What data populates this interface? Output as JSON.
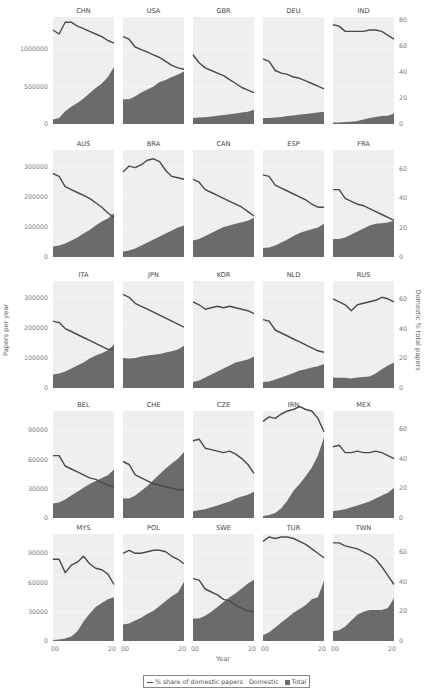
{
  "chart_data": {
    "type": "area",
    "title": "",
    "xlabel": "Year",
    "ylabel": "Papers per year",
    "y2label": "Domestic % total papers",
    "x": [
      2000,
      2002,
      2004,
      2006,
      2008,
      2010,
      2012,
      2014,
      2016,
      2018,
      2020
    ],
    "x_tick_labels": [
      "00",
      "20",
      "00",
      "20",
      "00",
      "20",
      "00",
      "20",
      "00",
      "20"
    ],
    "legend": [
      {
        "kind": "line",
        "label": "% share of domestic papers"
      },
      {
        "kind": "text",
        "label": "Domestic"
      },
      {
        "kind": "box",
        "label": "Total"
      }
    ],
    "colors": {
      "area": "#6b6b6b",
      "line": "#4a4a4a",
      "panel": "#efefef"
    },
    "rows": [
      {
        "left_ticks": [
          0,
          500000,
          1000000
        ],
        "left_tick_labels": [
          "0",
          "500000",
          "1000000"
        ],
        "left_max": 1430000,
        "right_ticks": [
          0,
          20,
          40,
          60,
          80
        ],
        "right_max": 82,
        "panels": [
          {
            "name": "CHN",
            "total": [
              60000,
              80000,
              170000,
              230000,
              280000,
              340000,
              410000,
              480000,
              540000,
              630000,
              760000
            ],
            "share": [
              72,
              69,
              78,
              78,
              75,
              73,
              71,
              69,
              67,
              64,
              62
            ]
          },
          {
            "name": "USA",
            "total": [
              330000,
              330000,
              370000,
              420000,
              460000,
              500000,
              560000,
              590000,
              630000,
              660000,
              700000
            ],
            "share": [
              67,
              65,
              59,
              57,
              55,
              53,
              51,
              48,
              45,
              43,
              42
            ]
          },
          {
            "name": "GBR",
            "total": [
              80000,
              85000,
              90000,
              100000,
              110000,
              120000,
              130000,
              140000,
              155000,
              165000,
              190000
            ],
            "share": [
              53,
              47,
              43,
              41,
              39,
              37,
              34,
              31,
              28,
              26,
              24
            ]
          },
          {
            "name": "DEU",
            "total": [
              80000,
              80000,
              85000,
              95000,
              105000,
              115000,
              125000,
              135000,
              145000,
              155000,
              165000
            ],
            "share": [
              50,
              48,
              41,
              39,
              38,
              36,
              35,
              33,
              31,
              29,
              27
            ]
          },
          {
            "name": "IND",
            "total": [
              20000,
              22000,
              25000,
              30000,
              40000,
              60000,
              80000,
              95000,
              105000,
              110000,
              140000
            ],
            "share": [
              76,
              75,
              71,
              71,
              71,
              71,
              72,
              72,
              71,
              68,
              65
            ]
          }
        ]
      },
      {
        "left_ticks": [
          0,
          100000,
          200000,
          300000
        ],
        "left_tick_labels": [
          "0",
          "100000",
          "200000",
          "300000"
        ],
        "left_max": 355000,
        "right_ticks": [
          0,
          20,
          40,
          60
        ],
        "right_max": 73,
        "panels": [
          {
            "name": "AUS",
            "total": [
              35000,
              38000,
              45000,
              55000,
              65000,
              78000,
              90000,
              105000,
              118000,
              128000,
              145000
            ],
            "share": [
              57,
              55,
              48,
              46,
              44,
              42,
              40,
              37,
              34,
              30,
              27
            ]
          },
          {
            "name": "BRA",
            "total": [
              18000,
              22000,
              28000,
              38000,
              48000,
              58000,
              68000,
              78000,
              88000,
              98000,
              105000
            ],
            "share": [
              58,
              62,
              61,
              63,
              66,
              67,
              65,
              59,
              55,
              54,
              53
            ]
          },
          {
            "name": "CAN",
            "total": [
              55000,
              60000,
              70000,
              80000,
              90000,
              100000,
              105000,
              110000,
              115000,
              120000,
              130000
            ],
            "share": [
              53,
              51,
              46,
              44,
              42,
              40,
              38,
              36,
              34,
              31,
              28
            ]
          },
          {
            "name": "ESP",
            "total": [
              30000,
              32000,
              38000,
              48000,
              58000,
              70000,
              80000,
              86000,
              92000,
              98000,
              110000
            ],
            "share": [
              56,
              55,
              49,
              47,
              45,
              43,
              41,
              39,
              36,
              34,
              34
            ]
          },
          {
            "name": "FRA",
            "total": [
              60000,
              60000,
              65000,
              75000,
              85000,
              95000,
              105000,
              110000,
              112000,
              114000,
              120000
            ],
            "share": [
              46,
              46,
              40,
              38,
              36,
              35,
              33,
              31,
              29,
              27,
              25
            ]
          }
        ]
      },
      {
        "left_ticks": [
          0,
          100000,
          200000,
          300000
        ],
        "left_tick_labels": [
          "0",
          "100000",
          "200000",
          "300000"
        ],
        "left_max": 355000,
        "right_ticks": [
          0,
          20,
          40,
          60
        ],
        "right_max": 72,
        "panels": [
          {
            "name": "ITA",
            "total": [
              45000,
              48000,
              55000,
              65000,
              75000,
              85000,
              98000,
              108000,
              115000,
              125000,
              145000
            ],
            "share": [
              45,
              44,
              40,
              38,
              36,
              34,
              32,
              30,
              28,
              26,
              26
            ]
          },
          {
            "name": "JPN",
            "total": [
              100000,
              98000,
              100000,
              105000,
              108000,
              110000,
              113000,
              118000,
              122000,
              128000,
              140000
            ],
            "share": [
              63,
              61,
              57,
              55,
              53,
              51,
              49,
              47,
              45,
              43,
              41
            ]
          },
          {
            "name": "KOR",
            "total": [
              20000,
              25000,
              35000,
              45000,
              55000,
              65000,
              75000,
              85000,
              90000,
              95000,
              105000
            ],
            "share": [
              58,
              56,
              53,
              54,
              55,
              54,
              55,
              54,
              53,
              52,
              50
            ]
          },
          {
            "name": "NLD",
            "total": [
              20000,
              22000,
              28000,
              35000,
              42000,
              50000,
              58000,
              62000,
              68000,
              72000,
              80000
            ],
            "share": [
              46,
              45,
              39,
              37,
              35,
              33,
              31,
              29,
              27,
              25,
              24
            ]
          },
          {
            "name": "RUS",
            "total": [
              35000,
              34000,
              34000,
              32000,
              35000,
              36000,
              38000,
              48000,
              62000,
              75000,
              85000
            ],
            "share": [
              60,
              58,
              56,
              52,
              56,
              57,
              58,
              59,
              61,
              60,
              58
            ]
          }
        ]
      },
      {
        "left_ticks": [
          0,
          30000,
          60000,
          90000
        ],
        "left_tick_labels": [
          "0",
          "30000",
          "60000",
          "90000"
        ],
        "left_max": 110000,
        "right_ticks": [
          0,
          20,
          40,
          60
        ],
        "right_max": 72,
        "panels": [
          {
            "name": "BEL",
            "total": [
              15000,
              16000,
              19000,
              23000,
              27000,
              31000,
              35000,
              38000,
              41000,
              44000,
              50000
            ],
            "share": [
              42,
              42,
              35,
              33,
              31,
              29,
              27,
              26,
              24,
              22,
              21
            ]
          },
          {
            "name": "CHE",
            "total": [
              20000,
              20000,
              23000,
              28000,
              33000,
              39000,
              45000,
              51000,
              56000,
              61000,
              68000
            ],
            "share": [
              38,
              36,
              29,
              27,
              25,
              23,
              22,
              21,
              20,
              19,
              19
            ]
          },
          {
            "name": "CZE",
            "total": [
              7000,
              8000,
              9000,
              11000,
              13000,
              15000,
              17000,
              20000,
              22000,
              24000,
              27000
            ],
            "share": [
              52,
              53,
              47,
              46,
              45,
              44,
              45,
              43,
              40,
              36,
              30
            ]
          },
          {
            "name": "IRN",
            "total": [
              2000,
              3000,
              5000,
              10000,
              18000,
              28000,
              35000,
              43000,
              52000,
              64000,
              83000
            ],
            "share": [
              65,
              68,
              67,
              70,
              72,
              73,
              75,
              73,
              72,
              67,
              58
            ]
          },
          {
            "name": "MEX",
            "total": [
              7000,
              8000,
              9000,
              11000,
              13000,
              15000,
              17000,
              20000,
              23000,
              26000,
              31000
            ],
            "share": [
              48,
              49,
              44,
              44,
              45,
              44,
              44,
              45,
              44,
              42,
              40
            ]
          }
        ]
      },
      {
        "left_ticks": [
          0,
          30000,
          60000,
          90000
        ],
        "left_tick_labels": [
          "0",
          "30000",
          "60000",
          "90000"
        ],
        "left_max": 110000,
        "right_ticks": [
          0,
          20,
          40,
          60
        ],
        "right_max": 72,
        "panels": [
          {
            "name": "MYS",
            "total": [
              1000,
              1500,
              2500,
              4500,
              10000,
              20000,
              28000,
              35000,
              39000,
              43000,
              45000
            ],
            "share": [
              55,
              55,
              46,
              51,
              53,
              57,
              52,
              49,
              48,
              45,
              38
            ]
          },
          {
            "name": "POL",
            "total": [
              17000,
              18000,
              21000,
              24000,
              28000,
              31000,
              36000,
              41000,
              46000,
              50000,
              61000
            ],
            "share": [
              59,
              61,
              59,
              59,
              60,
              61,
              61,
              60,
              57,
              55,
              52
            ]
          },
          {
            "name": "SWE",
            "total": [
              23000,
              23000,
              26000,
              30000,
              35000,
              40000,
              45000,
              49000,
              54000,
              59000,
              63000
            ],
            "share": [
              42,
              41,
              35,
              33,
              31,
              28,
              27,
              24,
              22,
              20,
              20
            ]
          },
          {
            "name": "TUR",
            "total": [
              6000,
              9000,
              14000,
              19000,
              24000,
              29000,
              33000,
              37000,
              43000,
              45000,
              62000
            ],
            "share": [
              67,
              70,
              69,
              70,
              70,
              69,
              67,
              65,
              62,
              59,
              56
            ]
          },
          {
            "name": "TWN",
            "total": [
              10000,
              11000,
              15000,
              21000,
              27000,
              30000,
              32000,
              32000,
              32000,
              34000,
              44000
            ],
            "share": [
              66,
              66,
              64,
              63,
              62,
              60,
              58,
              55,
              50,
              44,
              38
            ]
          }
        ]
      }
    ]
  }
}
